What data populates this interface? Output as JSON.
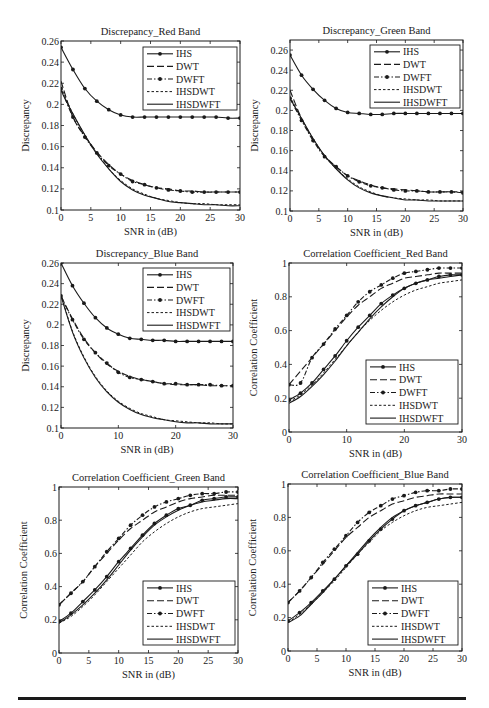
{
  "figure": {
    "x_ticks_5": [
      0,
      5,
      10,
      15,
      20,
      25,
      30
    ],
    "x_ticks_10": [
      0,
      10,
      20,
      30
    ],
    "legend_labels": [
      "IHS",
      "DWT",
      "DWFT",
      "IHSDWT",
      "IHSDWFT"
    ],
    "line_color": "#1a1a1a"
  },
  "chart_data": [
    {
      "id": "disc-red",
      "type": "line",
      "title": "Discrepancy_Red Band",
      "xlabel": "SNR in (dB)",
      "ylabel": "Discrepancy",
      "xlim": [
        0,
        30
      ],
      "ylim": [
        0.1,
        0.26
      ],
      "xticks": [
        0,
        5,
        10,
        15,
        20,
        25,
        30
      ],
      "yticks": [
        0.1,
        0.12,
        0.14,
        0.16,
        0.18,
        0.2,
        0.22,
        0.24,
        0.26
      ],
      "ytick_labels": [
        "0.1",
        "0.12",
        "0.14",
        "0.16",
        "0.18",
        "0.2",
        "0.22",
        "0.24",
        "0.26"
      ],
      "legend_position": "upper right",
      "grid": false,
      "x": [
        0,
        2,
        4,
        6,
        8,
        10,
        12,
        14,
        16,
        18,
        20,
        22,
        24,
        26,
        28,
        30
      ],
      "series": [
        {
          "name": "IHS",
          "values": [
            0.254,
            0.233,
            0.215,
            0.203,
            0.195,
            0.19,
            0.188,
            0.188,
            0.188,
            0.188,
            0.188,
            0.188,
            0.188,
            0.188,
            0.187,
            0.187
          ]
        },
        {
          "name": "DWT",
          "values": [
            0.222,
            0.188,
            0.17,
            0.155,
            0.143,
            0.134,
            0.128,
            0.124,
            0.121,
            0.12,
            0.118,
            0.118,
            0.117,
            0.117,
            0.117,
            0.117
          ]
        },
        {
          "name": "DWFT",
          "values": [
            0.215,
            0.188,
            0.169,
            0.154,
            0.142,
            0.134,
            0.127,
            0.124,
            0.121,
            0.119,
            0.118,
            0.117,
            0.117,
            0.117,
            0.117,
            0.117
          ]
        },
        {
          "name": "IHSDWT",
          "values": [
            0.216,
            0.191,
            0.171,
            0.154,
            0.139,
            0.128,
            0.12,
            0.115,
            0.111,
            0.109,
            0.107,
            0.106,
            0.106,
            0.105,
            0.105,
            0.105
          ]
        },
        {
          "name": "IHSDWFT",
          "values": [
            0.213,
            0.191,
            0.171,
            0.153,
            0.139,
            0.127,
            0.119,
            0.114,
            0.111,
            0.108,
            0.107,
            0.106,
            0.105,
            0.105,
            0.104,
            0.104
          ]
        }
      ]
    },
    {
      "id": "disc-green",
      "type": "line",
      "title": "Discrepancy_Green Band",
      "xlabel": "SNR in (dB)",
      "ylabel": "Discrepancy",
      "xlim": [
        0,
        30
      ],
      "ylim": [
        0.1,
        0.27
      ],
      "xticks": [
        0,
        5,
        10,
        15,
        20,
        25,
        30
      ],
      "yticks": [
        0.1,
        0.12,
        0.14,
        0.16,
        0.18,
        0.2,
        0.22,
        0.24,
        0.26
      ],
      "ytick_labels": [
        "0.1",
        "0.12",
        "0.14",
        "0.16",
        "0.18",
        "0.2",
        "0.22",
        "0.24",
        "0.26"
      ],
      "legend_position": "upper right",
      "grid": false,
      "x": [
        0,
        2,
        4,
        6,
        8,
        10,
        12,
        14,
        16,
        18,
        20,
        22,
        24,
        26,
        28,
        30
      ],
      "series": [
        {
          "name": "IHS",
          "values": [
            0.255,
            0.235,
            0.221,
            0.21,
            0.202,
            0.198,
            0.197,
            0.196,
            0.196,
            0.197,
            0.197,
            0.197,
            0.197,
            0.197,
            0.197,
            0.197
          ]
        },
        {
          "name": "DWT",
          "values": [
            0.22,
            0.192,
            0.171,
            0.155,
            0.144,
            0.135,
            0.13,
            0.126,
            0.123,
            0.122,
            0.121,
            0.12,
            0.119,
            0.119,
            0.119,
            0.119
          ]
        },
        {
          "name": "DWFT",
          "values": [
            0.212,
            0.19,
            0.17,
            0.154,
            0.144,
            0.135,
            0.129,
            0.125,
            0.123,
            0.121,
            0.12,
            0.12,
            0.119,
            0.119,
            0.119,
            0.118
          ]
        },
        {
          "name": "IHSDWT",
          "values": [
            0.214,
            0.192,
            0.172,
            0.155,
            0.142,
            0.132,
            0.124,
            0.119,
            0.115,
            0.113,
            0.112,
            0.111,
            0.111,
            0.11,
            0.11,
            0.11
          ]
        },
        {
          "name": "IHSDWFT",
          "values": [
            0.212,
            0.192,
            0.172,
            0.155,
            0.142,
            0.131,
            0.123,
            0.118,
            0.115,
            0.113,
            0.111,
            0.111,
            0.11,
            0.11,
            0.11,
            0.11
          ]
        }
      ]
    },
    {
      "id": "disc-blue",
      "type": "line",
      "title": "Discrepancy_Blue Band",
      "xlabel": "SNR in (dB)",
      "ylabel": "Discrepancy",
      "xlim": [
        0,
        30
      ],
      "ylim": [
        0.1,
        0.26
      ],
      "xticks": [
        0,
        10,
        20,
        30
      ],
      "yticks": [
        0.1,
        0.12,
        0.14,
        0.16,
        0.18,
        0.2,
        0.22,
        0.24,
        0.26
      ],
      "ytick_labels": [
        "0.1",
        "0.12",
        "0.14",
        "0.16",
        "0.18",
        "0.2",
        "0.22",
        "0.24",
        "0.26"
      ],
      "legend_position": "upper right",
      "grid": false,
      "x": [
        0,
        2,
        4,
        6,
        8,
        10,
        12,
        14,
        16,
        18,
        20,
        22,
        24,
        26,
        28,
        30
      ],
      "series": [
        {
          "name": "IHS",
          "values": [
            0.26,
            0.238,
            0.221,
            0.207,
            0.197,
            0.191,
            0.187,
            0.186,
            0.185,
            0.185,
            0.184,
            0.184,
            0.184,
            0.184,
            0.184,
            0.184
          ]
        },
        {
          "name": "DWT",
          "values": [
            0.228,
            0.206,
            0.187,
            0.173,
            0.162,
            0.155,
            0.15,
            0.147,
            0.145,
            0.143,
            0.142,
            0.142,
            0.142,
            0.141,
            0.141,
            0.141
          ]
        },
        {
          "name": "DWFT",
          "values": [
            0.228,
            0.205,
            0.186,
            0.173,
            0.163,
            0.154,
            0.149,
            0.147,
            0.145,
            0.143,
            0.143,
            0.142,
            0.142,
            0.142,
            0.141,
            0.141
          ]
        },
        {
          "name": "IHSDWT",
          "values": [
            0.229,
            0.194,
            0.169,
            0.15,
            0.136,
            0.126,
            0.119,
            0.114,
            0.111,
            0.108,
            0.107,
            0.106,
            0.105,
            0.105,
            0.104,
            0.104
          ]
        },
        {
          "name": "IHSDWFT",
          "values": [
            0.228,
            0.193,
            0.168,
            0.149,
            0.135,
            0.125,
            0.118,
            0.113,
            0.11,
            0.108,
            0.106,
            0.105,
            0.105,
            0.104,
            0.104,
            0.104
          ]
        }
      ]
    },
    {
      "id": "cc-red",
      "type": "line",
      "title": "Correlation Coefficient_Red Band",
      "xlabel": "SNR in (dB)",
      "ylabel": "Correlation Coefficient",
      "xlim": [
        0,
        30
      ],
      "ylim": [
        0,
        1
      ],
      "xticks": [
        0,
        10,
        20,
        30
      ],
      "yticks": [
        0,
        0.2,
        0.4,
        0.6,
        0.8,
        1
      ],
      "ytick_labels": [
        "0",
        "0.2",
        "0.4",
        "0.6",
        "0.8",
        "1"
      ],
      "legend_position": "lower right",
      "grid": false,
      "x": [
        0,
        2,
        4,
        6,
        8,
        10,
        12,
        14,
        16,
        18,
        20,
        22,
        24,
        26,
        28,
        30
      ],
      "series": [
        {
          "name": "IHS",
          "values": [
            0.19,
            0.23,
            0.29,
            0.37,
            0.45,
            0.54,
            0.62,
            0.69,
            0.76,
            0.81,
            0.85,
            0.88,
            0.9,
            0.92,
            0.93,
            0.93
          ]
        },
        {
          "name": "DWT",
          "values": [
            0.28,
            0.36,
            0.44,
            0.52,
            0.6,
            0.68,
            0.75,
            0.8,
            0.85,
            0.88,
            0.91,
            0.92,
            0.93,
            0.94,
            0.94,
            0.94
          ]
        },
        {
          "name": "DWFT",
          "values": [
            0.28,
            0.29,
            0.44,
            0.52,
            0.61,
            0.69,
            0.77,
            0.83,
            0.87,
            0.91,
            0.94,
            0.95,
            0.96,
            0.97,
            0.97,
            0.97
          ]
        },
        {
          "name": "IHSDWT",
          "values": [
            0.18,
            0.22,
            0.28,
            0.35,
            0.43,
            0.51,
            0.59,
            0.66,
            0.72,
            0.77,
            0.81,
            0.84,
            0.86,
            0.88,
            0.89,
            0.9
          ]
        },
        {
          "name": "IHSDWFT",
          "values": [
            0.17,
            0.21,
            0.27,
            0.34,
            0.42,
            0.51,
            0.59,
            0.67,
            0.74,
            0.8,
            0.85,
            0.88,
            0.9,
            0.91,
            0.92,
            0.93
          ]
        }
      ]
    },
    {
      "id": "cc-green",
      "type": "line",
      "title": "Correlation Coefficient_Green Band",
      "xlabel": "SNR in (dB)",
      "ylabel": "Correlation Coefficient",
      "xlim": [
        0,
        30
      ],
      "ylim": [
        0,
        1
      ],
      "xticks": [
        0,
        5,
        10,
        15,
        20,
        25,
        30
      ],
      "yticks": [
        0,
        0.2,
        0.4,
        0.6,
        0.8,
        1
      ],
      "ytick_labels": [
        "0",
        "0.2",
        "0.4",
        "0.6",
        "0.8",
        "1"
      ],
      "legend_position": "lower right",
      "grid": false,
      "x": [
        0,
        2,
        4,
        6,
        8,
        10,
        12,
        14,
        16,
        18,
        20,
        22,
        24,
        26,
        28,
        30
      ],
      "series": [
        {
          "name": "IHS",
          "values": [
            0.19,
            0.24,
            0.31,
            0.38,
            0.46,
            0.55,
            0.63,
            0.71,
            0.78,
            0.83,
            0.87,
            0.89,
            0.92,
            0.93,
            0.94,
            0.94
          ]
        },
        {
          "name": "DWT",
          "values": [
            0.29,
            0.36,
            0.43,
            0.52,
            0.6,
            0.68,
            0.75,
            0.8,
            0.85,
            0.88,
            0.91,
            0.93,
            0.94,
            0.95,
            0.95,
            0.95
          ]
        },
        {
          "name": "DWFT",
          "values": [
            0.29,
            0.36,
            0.43,
            0.52,
            0.61,
            0.69,
            0.77,
            0.83,
            0.88,
            0.91,
            0.93,
            0.95,
            0.96,
            0.96,
            0.97,
            0.97
          ]
        },
        {
          "name": "IHSDWT",
          "values": [
            0.18,
            0.22,
            0.28,
            0.35,
            0.43,
            0.51,
            0.59,
            0.67,
            0.73,
            0.78,
            0.82,
            0.85,
            0.87,
            0.88,
            0.89,
            0.9
          ]
        },
        {
          "name": "IHSDWFT",
          "values": [
            0.18,
            0.23,
            0.29,
            0.36,
            0.44,
            0.53,
            0.62,
            0.7,
            0.77,
            0.82,
            0.86,
            0.89,
            0.91,
            0.92,
            0.93,
            0.93
          ]
        }
      ]
    },
    {
      "id": "cc-blue",
      "type": "line",
      "title": "Correlation Coefficient_Blue Band",
      "xlabel": "SNR in (dB)",
      "ylabel": "Correlation Coefficient",
      "xlim": [
        0,
        30
      ],
      "ylim": [
        0,
        1
      ],
      "xticks": [
        0,
        5,
        10,
        15,
        20,
        25,
        30
      ],
      "yticks": [
        0,
        0.2,
        0.4,
        0.6,
        0.8,
        1
      ],
      "ytick_labels": [
        "0",
        "0.2",
        "0.4",
        "0.6",
        "0.8",
        "1"
      ],
      "legend_position": "lower right",
      "grid": false,
      "x": [
        0,
        2,
        4,
        6,
        8,
        10,
        12,
        14,
        16,
        18,
        20,
        22,
        24,
        26,
        28,
        30
      ],
      "series": [
        {
          "name": "IHS",
          "values": [
            0.18,
            0.23,
            0.29,
            0.36,
            0.43,
            0.51,
            0.58,
            0.66,
            0.73,
            0.79,
            0.84,
            0.87,
            0.89,
            0.91,
            0.92,
            0.92
          ]
        },
        {
          "name": "DWT",
          "values": [
            0.29,
            0.36,
            0.44,
            0.52,
            0.6,
            0.68,
            0.74,
            0.8,
            0.84,
            0.88,
            0.9,
            0.92,
            0.93,
            0.94,
            0.94,
            0.94
          ]
        },
        {
          "name": "DWFT",
          "values": [
            0.29,
            0.36,
            0.44,
            0.53,
            0.61,
            0.69,
            0.77,
            0.83,
            0.87,
            0.91,
            0.93,
            0.95,
            0.96,
            0.96,
            0.97,
            0.97
          ]
        },
        {
          "name": "IHSDWT",
          "values": [
            0.17,
            0.22,
            0.28,
            0.35,
            0.42,
            0.5,
            0.58,
            0.65,
            0.72,
            0.77,
            0.81,
            0.84,
            0.86,
            0.87,
            0.88,
            0.89
          ]
        },
        {
          "name": "IHSDWFT",
          "values": [
            0.17,
            0.21,
            0.28,
            0.35,
            0.43,
            0.51,
            0.59,
            0.67,
            0.74,
            0.8,
            0.84,
            0.87,
            0.89,
            0.91,
            0.92,
            0.92
          ]
        }
      ]
    }
  ]
}
